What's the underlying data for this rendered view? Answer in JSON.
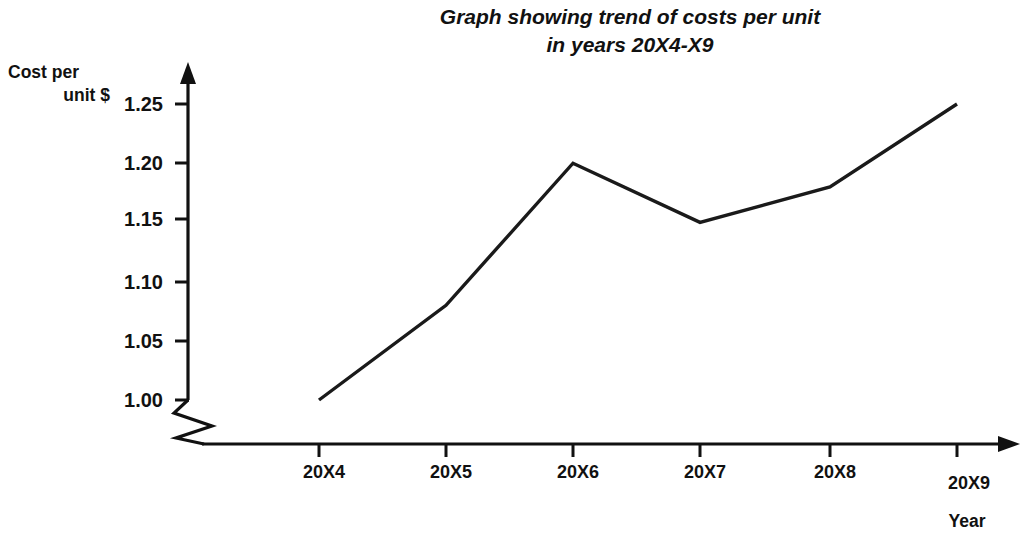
{
  "page": {
    "width": 1036,
    "height": 550,
    "background": "#ffffff",
    "ink_color": "#111111"
  },
  "title": {
    "line1": "Graph showing trend of costs per unit",
    "line2": "in years 20X4-X9"
  },
  "axes": {
    "y_label_line1": "Cost per",
    "y_label_line2": "unit $",
    "x_label": "Year",
    "y_ticks": [
      "1.00",
      "1.05",
      "1.10",
      "1.15",
      "1.20",
      "1.25"
    ],
    "x_ticks": [
      "20X4",
      "20X5",
      "20X6",
      "20X7",
      "20X8",
      "20X9"
    ],
    "axis_break": "y-axis-break-zigzag"
  },
  "chart_data": {
    "type": "line",
    "title": "Graph showing trend of costs per unit in years 20X4-X9",
    "xlabel": "Year",
    "ylabel": "Cost per unit $",
    "categories": [
      "20X4",
      "20X5",
      "20X6",
      "20X7",
      "20X8",
      "20X9"
    ],
    "values": [
      1.0,
      1.08,
      1.2,
      1.15,
      1.18,
      1.25
    ],
    "ylim": [
      1.0,
      1.25
    ],
    "yticks": [
      1.0,
      1.05,
      1.1,
      1.15,
      1.2,
      1.25
    ],
    "grid": false,
    "legend": "none",
    "axis_break_below": 1.0,
    "line_color": "#1a1a1a",
    "markers": "none"
  },
  "geometry": {
    "y_pixels": {
      "1.00": 400,
      "1.05": 341,
      "1.10": 282,
      "1.15": 219,
      "1.20": 163,
      "1.25": 104
    },
    "x_pixels": {
      "20X4": 319,
      "20X5": 446,
      "20X6": 573,
      "20X7": 700,
      "20X8": 830,
      "20X9": 957
    },
    "point_pixels": [
      [
        319,
        400
      ],
      [
        446,
        305
      ],
      [
        573,
        162
      ],
      [
        700,
        220
      ],
      [
        830,
        184
      ],
      [
        957,
        100
      ]
    ],
    "y_axis_x": 188,
    "x_axis_y": 444
  }
}
